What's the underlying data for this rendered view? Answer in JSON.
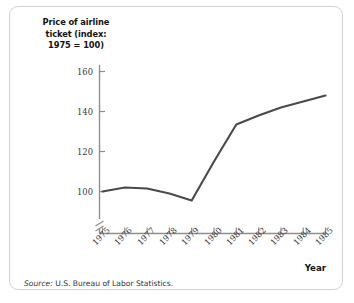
{
  "figure": {
    "title_lines": [
      "Price of airline",
      "ticket (index:",
      "1975 = 100)"
    ],
    "source": {
      "lead": "Source:",
      "text": " U.S. Bureau of Labor Statistics."
    },
    "xaxis_title": "Year",
    "colors": {
      "line": "#4a4a4a",
      "axis": "#8f8f8f",
      "border": "#d2d2d2",
      "text": "#131313",
      "background": "#ffffff"
    }
  },
  "chart_data": {
    "type": "line",
    "title": "Price of airline ticket (index: 1975 = 100)",
    "xlabel": "Year",
    "ylabel": "Price of airline ticket (index: 1975 = 100)",
    "categories": [
      "1975",
      "1976",
      "1977",
      "1978",
      "1979",
      "1980",
      "1981",
      "1982",
      "1983",
      "1984",
      "1985"
    ],
    "x": [
      1975,
      1976,
      1977,
      1978,
      1979,
      1980,
      1981,
      1982,
      1983,
      1984,
      1985
    ],
    "values": [
      100,
      102,
      101.5,
      99,
      95.5,
      115,
      133.5,
      138,
      142,
      145,
      148
    ],
    "yticks": [
      100,
      120,
      140,
      160
    ],
    "ylim": [
      93,
      165
    ],
    "xlim": [
      1975,
      1985
    ],
    "grid": false,
    "legend": null,
    "axis_break": true,
    "series": [
      {
        "name": "Price of airline ticket (index: 1975 = 100)",
        "values": [
          100,
          102,
          101.5,
          99,
          95.5,
          115,
          133.5,
          138,
          142,
          145,
          148
        ]
      }
    ]
  }
}
